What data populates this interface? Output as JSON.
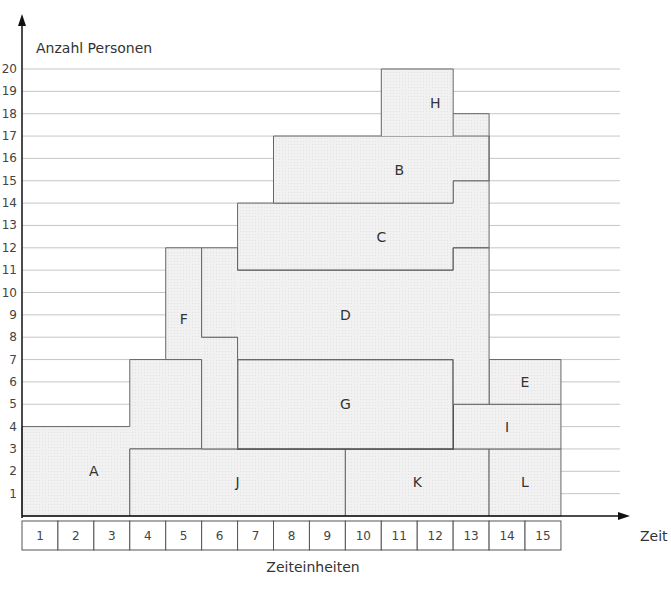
{
  "chart_data": {
    "type": "resource-histogram",
    "title": "",
    "ylabel": "Anzahl Personen",
    "xlabel": "Zeiteinheiten",
    "x_axis_arrow_label": "Zeit",
    "ylim": [
      0,
      20
    ],
    "xlim": [
      0,
      15
    ],
    "yticks": [
      1,
      2,
      3,
      4,
      5,
      6,
      7,
      8,
      9,
      10,
      11,
      12,
      13,
      14,
      15,
      16,
      17,
      18,
      19,
      20
    ],
    "time_units": [
      1,
      2,
      3,
      4,
      5,
      6,
      7,
      8,
      9,
      10,
      11,
      12,
      13,
      14,
      15
    ],
    "grid": true,
    "blocks": [
      {
        "name": "A",
        "polygon": [
          [
            0,
            0
          ],
          [
            3,
            0
          ],
          [
            3,
            3
          ],
          [
            5,
            3
          ],
          [
            5,
            7
          ],
          [
            3,
            7
          ],
          [
            3,
            4
          ],
          [
            0,
            4
          ]
        ],
        "label_pos": [
          2,
          2
        ]
      },
      {
        "name": "J",
        "polygon": [
          [
            3,
            0
          ],
          [
            9,
            0
          ],
          [
            9,
            3
          ],
          [
            3,
            3
          ]
        ],
        "label_pos": [
          6,
          1.5
        ]
      },
      {
        "name": "K",
        "polygon": [
          [
            9,
            0
          ],
          [
            13,
            0
          ],
          [
            13,
            3
          ],
          [
            9,
            3
          ]
        ],
        "label_pos": [
          11,
          1.5
        ]
      },
      {
        "name": "L",
        "polygon": [
          [
            13,
            0
          ],
          [
            15,
            0
          ],
          [
            15,
            3
          ],
          [
            13,
            3
          ]
        ],
        "label_pos": [
          14,
          1.5
        ]
      },
      {
        "name": "I",
        "polygon": [
          [
            12,
            3
          ],
          [
            15,
            3
          ],
          [
            15,
            5
          ],
          [
            12,
            5
          ]
        ],
        "label_pos": [
          13.5,
          4
        ]
      },
      {
        "name": "E",
        "polygon": [
          [
            13,
            5
          ],
          [
            15,
            5
          ],
          [
            15,
            7
          ],
          [
            13,
            7
          ]
        ],
        "label_pos": [
          14,
          6
        ]
      },
      {
        "name": "G",
        "polygon": [
          [
            6,
            3
          ],
          [
            12,
            3
          ],
          [
            12,
            7
          ],
          [
            6,
            7
          ]
        ],
        "label_pos": [
          9,
          5
        ]
      },
      {
        "name": "F",
        "polygon": [
          [
            4,
            7
          ],
          [
            5,
            7
          ],
          [
            5,
            3
          ],
          [
            6,
            3
          ],
          [
            6,
            8
          ],
          [
            5,
            8
          ],
          [
            5,
            12
          ],
          [
            4,
            12
          ]
        ],
        "label_pos": [
          4.5,
          8.8
        ]
      },
      {
        "name": "D",
        "polygon": [
          [
            6,
            7
          ],
          [
            12,
            7
          ],
          [
            12,
            9
          ],
          [
            13,
            9
          ],
          [
            13,
            5
          ],
          [
            13,
            12
          ],
          [
            12,
            12
          ],
          [
            12,
            11
          ],
          [
            6,
            11
          ],
          [
            6,
            12
          ],
          [
            5,
            12
          ],
          [
            5,
            8
          ],
          [
            6,
            8
          ]
        ],
        "label_pos": [
          9,
          9
        ]
      },
      {
        "name": "C",
        "polygon": [
          [
            6,
            11
          ],
          [
            12,
            11
          ],
          [
            12,
            12
          ],
          [
            13,
            12
          ],
          [
            13,
            15
          ],
          [
            12,
            15
          ],
          [
            12,
            14
          ],
          [
            6,
            14
          ]
        ],
        "label_pos": [
          10,
          12.5
        ]
      },
      {
        "name": "B",
        "polygon": [
          [
            7,
            14
          ],
          [
            12,
            14
          ],
          [
            12,
            15
          ],
          [
            13,
            15
          ],
          [
            13,
            17
          ],
          [
            12,
            17
          ],
          [
            7,
            17
          ]
        ],
        "label_pos": [
          10.5,
          15.5
        ]
      },
      {
        "name": "H",
        "polygon": [
          [
            10,
            17
          ],
          [
            12,
            17
          ],
          [
            12,
            18
          ],
          [
            13,
            18
          ],
          [
            13,
            15
          ],
          [
            13,
            18
          ],
          [
            12,
            18
          ],
          [
            12,
            20
          ],
          [
            10,
            20
          ]
        ],
        "label_pos": [
          11.5,
          18.5
        ]
      }
    ],
    "peak_persons": 20,
    "peak_time_units": [
      11,
      12
    ]
  },
  "caption_partial": "Abb. 4.26: Einsatzplan, Kapazitätsbelastung (Beispiel)"
}
